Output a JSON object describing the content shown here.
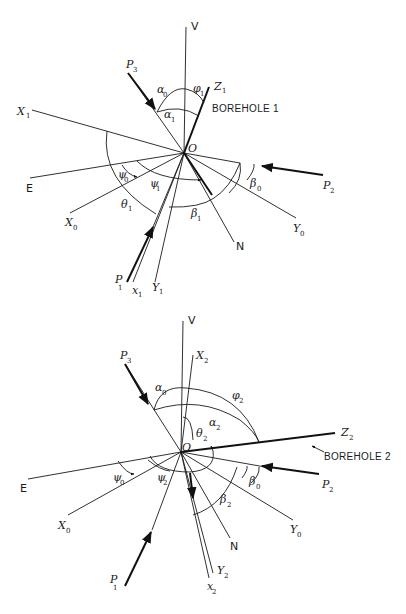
{
  "figure": {
    "diagram1": {
      "title": "BOREHOLE 1",
      "origin_label": "O",
      "axes": {
        "V": "V",
        "E": "E",
        "N": "N",
        "X0": {
          "main": "X",
          "sub": "0"
        },
        "Y0": {
          "main": "Y",
          "sub": "0"
        },
        "X1": {
          "main": "X",
          "sub": "1"
        },
        "Y1": {
          "main": "Y",
          "sub": "1"
        },
        "Z1": {
          "main": "Z",
          "sub": "1"
        },
        "x1": {
          "main": "x",
          "sub": "1"
        }
      },
      "stresses": {
        "P1": {
          "main": "P",
          "sub": "1"
        },
        "P2": {
          "main": "P",
          "sub": "2"
        },
        "P3": {
          "main": "P",
          "sub": "3"
        }
      },
      "angles": {
        "alpha0": {
          "main": "α",
          "sub": "0"
        },
        "alpha1": {
          "main": "α",
          "sub": "1"
        },
        "phi1": {
          "main": "φ",
          "sub": "1"
        },
        "psi0": {
          "main": "ψ",
          "sub": "0"
        },
        "psi1": {
          "main": "ψ",
          "sub": "1"
        },
        "theta1": {
          "main": "θ",
          "sub": "1"
        },
        "beta0": {
          "main": "β",
          "sub": "0"
        },
        "beta1": {
          "main": "β",
          "sub": "1"
        }
      }
    },
    "diagram2": {
      "title": "BOREHOLE 2",
      "origin_label": "O",
      "axes": {
        "V": "V",
        "E": "E",
        "N": "N",
        "X0": {
          "main": "X",
          "sub": "0"
        },
        "Y0": {
          "main": "Y",
          "sub": "0"
        },
        "X2": {
          "main": "X",
          "sub": "2"
        },
        "Y2": {
          "main": "Y",
          "sub": "2"
        },
        "Z2": {
          "main": "Z",
          "sub": "2"
        },
        "x2": {
          "main": "x",
          "sub": "2"
        }
      },
      "stresses": {
        "P1": {
          "main": "P",
          "sub": "1"
        },
        "P2": {
          "main": "P",
          "sub": "2"
        },
        "P3": {
          "main": "P",
          "sub": "3"
        }
      },
      "angles": {
        "alpha0": {
          "main": "α",
          "sub": "0"
        },
        "alpha2": {
          "main": "α",
          "sub": "2"
        },
        "phi2": {
          "main": "φ",
          "sub": "2"
        },
        "theta2": {
          "main": "θ",
          "sub": "2"
        },
        "psi0": {
          "main": "ψ",
          "sub": "0"
        },
        "psi2": {
          "main": "ψ",
          "sub": "2"
        },
        "beta0": {
          "main": "β",
          "sub": "0"
        },
        "beta2": {
          "main": "β",
          "sub": "2"
        }
      }
    },
    "colors": {
      "ink": "#1a1a1a",
      "paper": "#ffffff"
    }
  }
}
